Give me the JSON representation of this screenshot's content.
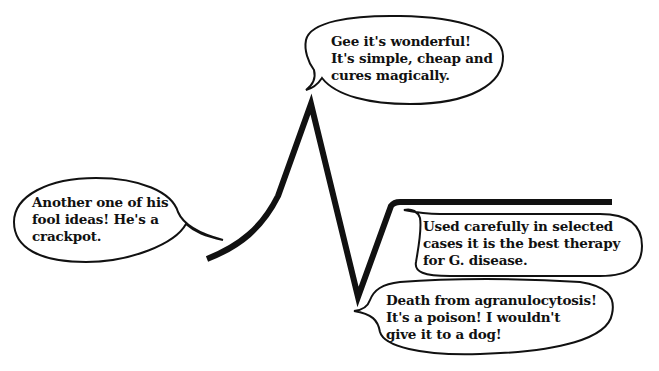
{
  "diagram": {
    "type": "hype-cycle-cartoon",
    "colors": {
      "ink": "#111111",
      "background": "#ffffff"
    },
    "curve": {
      "description": "Opinion curve: rise to peak, plunge to trough, recovery to plateau",
      "points": [
        {
          "x": 207,
          "y": 259,
          "label": "start"
        },
        {
          "x": 311,
          "y": 104,
          "label": "peak"
        },
        {
          "x": 358,
          "y": 297,
          "label": "trough"
        },
        {
          "x": 396,
          "y": 202,
          "label": "plateau-start"
        },
        {
          "x": 612,
          "y": 202,
          "label": "plateau-end"
        }
      ]
    },
    "bubbles": {
      "skeptic": {
        "stage": "early",
        "lines": [
          "Another one of his",
          "fool ideas! He's a",
          "crackpot."
        ]
      },
      "enthusiast": {
        "stage": "peak",
        "lines": [
          "Gee it's wonderful!",
          "It's simple, cheap and",
          "cures magically."
        ]
      },
      "condemnation": {
        "stage": "trough",
        "lines": [
          "Death from agranulocytosis!",
          "It's a poison! I wouldn't",
          "give it to a dog!"
        ]
      },
      "acceptance": {
        "stage": "plateau",
        "lines": [
          "Used carefully in selected",
          "cases it is the best therapy",
          "for G. disease."
        ]
      }
    }
  }
}
